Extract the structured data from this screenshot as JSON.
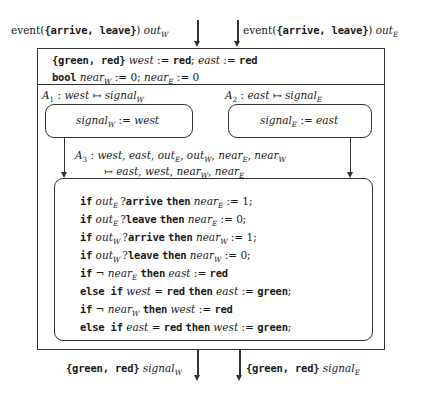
{
  "diagram": {
    "title_alt": "Actor model: railroad crossing controller",
    "input_ports": [
      {
        "type": "event({arrive, leave})",
        "name": "out",
        "name_sub": "W"
      },
      {
        "type": "event({arrive, leave})",
        "name": "out",
        "name_sub": "E"
      }
    ],
    "output_ports": [
      {
        "type": "{green, red}",
        "name": "signal",
        "name_sub": "W"
      },
      {
        "type": "{green, red}",
        "name": "signal",
        "name_sub": "E"
      }
    ],
    "declarations": [
      {
        "type": "{green, red}",
        "body": "west := red;  east := red"
      },
      {
        "type": "bool",
        "body": "near_W := 0;  near_E := 0"
      }
    ],
    "subactors": [
      {
        "id": "A1",
        "signature_in": "west",
        "signature_out": "signal",
        "signature_out_sub": "W",
        "body_lhs": "signal",
        "body_lhs_sub": "W",
        "body_rhs": "west"
      },
      {
        "id": "A2",
        "signature_in": "east",
        "signature_out": "signal",
        "signature_out_sub": "E",
        "body_lhs": "signal",
        "body_lhs_sub": "E",
        "body_rhs": "east"
      }
    ],
    "main_actor": {
      "id": "A3",
      "signature_line1": "west, east, out_E, out_W, near_E, near_W",
      "signature_line2": "east, west, near_W, near_E",
      "code": [
        "if out_E ? arrive then near_E := 1;",
        "if out_E ? leave then near_E := 0;",
        "if out_W ? arrive then near_W := 1;",
        "if out_W ? leave then near_W := 0;",
        "if ¬ near_E then east := red",
        "else if west = red then east := green;",
        "if ¬ near_W then west := red",
        "else if east = red then west := green;"
      ]
    },
    "colors": {
      "stroke": "#333333",
      "text": "#1a1a1a",
      "background": "#ffffff"
    }
  }
}
